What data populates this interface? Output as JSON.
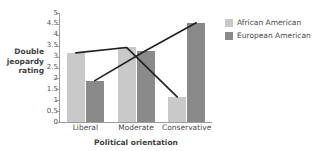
{
  "chart_data": {
    "type": "bar",
    "title": "",
    "xlabel": "Political orientation",
    "ylabel": "Double jeopardy rating",
    "ylabel_lines": [
      "Double",
      "jeopardy",
      "rating"
    ],
    "categories": [
      "Liberal",
      "Moderate",
      "Conservative"
    ],
    "series": [
      {
        "name": "African American",
        "color": "#c9c9c9",
        "values": [
          3.17,
          3.42,
          1.15
        ]
      },
      {
        "name": "European American",
        "color": "#8a8a8a",
        "values": [
          1.9,
          3.27,
          4.55
        ]
      }
    ],
    "ylim": [
      0,
      5
    ],
    "yticks": [
      0,
      0.5,
      1,
      1.5,
      2,
      2.5,
      3,
      3.5,
      4,
      4.5,
      5
    ],
    "ytick_labels": [
      "0",
      "0.5",
      "1",
      "1.5",
      "2",
      "2.5",
      "3",
      "3.5",
      "4",
      "4.5",
      "5"
    ],
    "grid": false,
    "legend_position": "right",
    "annotations": [
      {
        "name": "african-american-trend-line",
        "type": "line",
        "color": "#231f20",
        "points": [
          [
            0,
            3.17
          ],
          [
            1,
            3.42
          ],
          [
            2,
            1.15
          ]
        ]
      },
      {
        "name": "european-american-trend-line",
        "type": "line",
        "color": "#231f20",
        "points": [
          [
            0,
            1.9
          ],
          [
            1,
            3.27
          ],
          [
            2,
            4.55
          ]
        ]
      }
    ]
  },
  "legend": {
    "items": [
      {
        "label": "African American",
        "color": "#c9c9c9"
      },
      {
        "label": "European American",
        "color": "#8a8a8a"
      }
    ]
  },
  "axes": {
    "y_title_line1": "Double",
    "y_title_line2": "jeopardy",
    "y_title_line3": "rating",
    "x_title": "Political orientation"
  }
}
